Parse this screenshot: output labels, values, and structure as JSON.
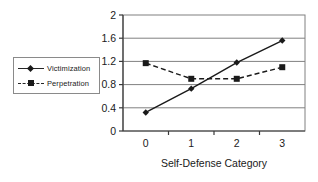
{
  "chart_data": {
    "type": "line",
    "title": "",
    "xlabel": "Self-Defense Category",
    "ylabel": "",
    "categories": [
      "0",
      "1",
      "2",
      "3"
    ],
    "x": [
      0,
      1,
      2,
      3
    ],
    "ylim": [
      0,
      2
    ],
    "yticks": [
      "0",
      "0.4",
      "0.8",
      "1.2",
      "1.6",
      "2"
    ],
    "ytick_values": [
      0,
      0.4,
      0.8,
      1.2,
      1.6,
      2
    ],
    "grid": "horizontal",
    "legend_position": "left-outside",
    "series": [
      {
        "name": "Victimization",
        "values": [
          0.32,
          0.73,
          1.18,
          1.56
        ],
        "line_style": "solid",
        "marker": "diamond",
        "color": "#1a1a1a"
      },
      {
        "name": "Perpetration",
        "values": [
          1.17,
          0.9,
          0.9,
          1.1
        ],
        "line_style": "dashed",
        "marker": "square",
        "color": "#1a1a1a"
      }
    ]
  },
  "legend": {
    "items": [
      {
        "label": "Victimization",
        "marker": "diamond-marker",
        "line": "solid-line"
      },
      {
        "label": "Perpetration",
        "marker": "square-marker",
        "line": "dashed-line"
      }
    ]
  },
  "axes": {
    "x_title": "Self-Defense Category",
    "x_labels": [
      "0",
      "1",
      "2",
      "3"
    ],
    "y_labels": [
      "2",
      "1.6",
      "1.2",
      "0.8",
      "0.4",
      "0"
    ]
  },
  "colors": {
    "series": "#1a1a1a",
    "grid": "#808080",
    "frame": "#808080",
    "background": "#ffffff"
  }
}
